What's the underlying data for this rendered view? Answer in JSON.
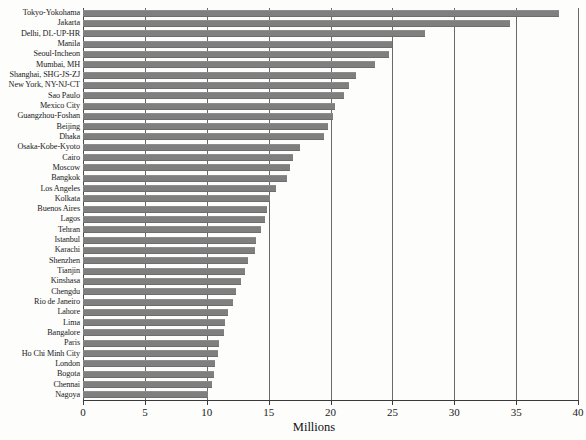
{
  "chart_data": {
    "type": "bar",
    "orientation": "horizontal",
    "title": "",
    "subtitle": "",
    "xlabel": "Millions",
    "ylabel": "",
    "xlim": [
      0,
      40
    ],
    "ylim": null,
    "grid": true,
    "gridlines_axis": "x",
    "legend": null,
    "legend_position": "none",
    "bar_color": "#7f7f7f",
    "xticks": [
      0,
      5,
      10,
      15,
      20,
      25,
      30,
      35,
      40
    ],
    "xtick_labels": [
      "0",
      "5",
      "10",
      "15",
      "20",
      "25",
      "30",
      "35",
      "40"
    ],
    "categories": [
      "Tokyo-Yokohama",
      "Jakarta",
      "Delhi, DL-UP-HR",
      "Manila",
      "Seoul-Incheon",
      "Mumbai, MH",
      "Shanghai, SHG-JS-ZJ",
      "New York, NY-NJ-CT",
      "Sao Paulo",
      "Mexico City",
      "Guangzhou-Foshan",
      "Beijing",
      "Dhaka",
      "Osaka-Kobe-Kyoto",
      "Cairo",
      "Moscow",
      "Bangkok",
      "Los Angeles",
      "Kolkata",
      "Buenos Aires",
      "Lagos",
      "Tehran",
      "Istanbul",
      "Karachi",
      "Shenzhen",
      "Tianjin",
      "Kinshasa",
      "Chengdu",
      "Rio de Janeiro",
      "Lahore",
      "Lima",
      "Bangalore",
      "Paris",
      "Ho Chi Minh City",
      "London",
      "Bogota",
      "Chennai",
      "Nagoya"
    ],
    "values": [
      38.5,
      34.5,
      27.6,
      25.0,
      24.7,
      23.6,
      22.1,
      21.5,
      21.1,
      20.4,
      20.2,
      19.8,
      19.5,
      17.5,
      17.0,
      16.7,
      16.5,
      15.6,
      15.1,
      14.9,
      14.7,
      14.4,
      14.0,
      13.9,
      13.3,
      13.1,
      12.8,
      12.4,
      12.1,
      11.7,
      11.5,
      11.4,
      11.0,
      10.9,
      10.7,
      10.6,
      10.4,
      10.1
    ]
  }
}
